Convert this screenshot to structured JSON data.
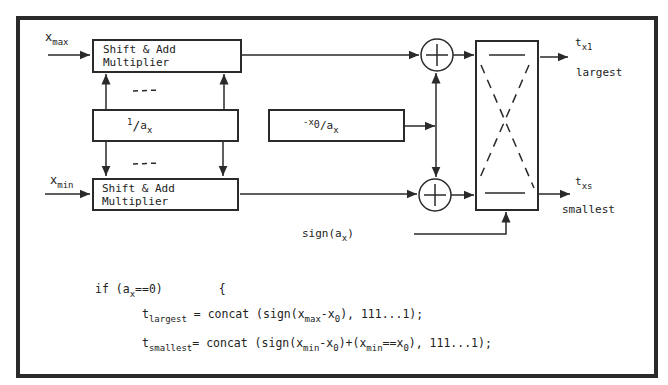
{
  "diagram": {
    "inputs": {
      "xmax": {
        "base": "x",
        "sub": "max"
      },
      "xmin": {
        "base": "x",
        "sub": "min"
      }
    },
    "blocks": {
      "top_multiplier": "Shift & Add Multiplier",
      "bottom_multiplier": "Shift & Add Multiplier",
      "reciprocal": {
        "pre": "1",
        "slash": "/",
        "base": "a",
        "sub": "x"
      },
      "offset": {
        "pre": "-x",
        "sub0": "0",
        "slash": "/a",
        "sub": "x"
      },
      "dashes_top": "---",
      "dashes_bottom": "---"
    },
    "adders": {
      "symbol": "+"
    },
    "sign_label": {
      "pre": "sign(a",
      "sub": "x",
      "post": ")"
    },
    "outputs": {
      "largest": {
        "base": "t",
        "sub": "x1",
        "caption": "largest"
      },
      "smallest": {
        "base": "t",
        "sub": "xs",
        "caption": "smallest"
      }
    },
    "code": {
      "line1": {
        "pre": "if (a",
        "sub": "x",
        "post": "==0)",
        "brace": "{"
      },
      "line2": {
        "t": "t",
        "tsub": "largest",
        "a": " = concat (sign(x",
        "asub": "max",
        "b": "-x",
        "bsub": "0",
        "c": "), 111...1);"
      },
      "line3": {
        "t": "t",
        "tsub": "smallest",
        "a": "= concat (sign(x",
        "asub": "min",
        "b": "-x",
        "bsub": "0",
        "c": ")+(x",
        "csub": "min",
        "d": "==x",
        "dsub": "0",
        "e": "), 111...1);"
      }
    }
  }
}
